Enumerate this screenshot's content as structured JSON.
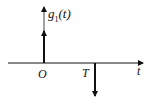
{
  "diagram": {
    "function_label": "g",
    "function_sub": "1",
    "function_arg": "(t)",
    "origin_label": "O",
    "impulse_label": "T",
    "axis_label": "t"
  },
  "colors": {
    "ink": "#111111",
    "background": "#ffffff"
  }
}
